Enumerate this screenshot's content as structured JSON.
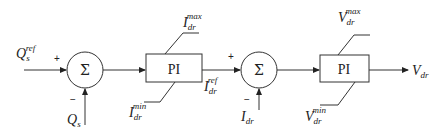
{
  "diagram": {
    "type": "control-block-diagram",
    "stroke_color": "#333333",
    "background": "#ffffff",
    "inputs": {
      "q_ref": {
        "base": "Q",
        "sub": "s",
        "sup": "ref"
      },
      "q_meas": {
        "base": "Q",
        "sub": "s"
      },
      "i_meas": {
        "base": "I",
        "sub": "dr"
      }
    },
    "sum1": {
      "symbol": "Σ",
      "plus": "+",
      "minus": "−"
    },
    "pi1": {
      "label": "PI",
      "max": {
        "base": "I",
        "sub": "dr",
        "sup": "max"
      },
      "min": {
        "base": "I",
        "sub": "dr",
        "sup": "min"
      }
    },
    "intermediate": {
      "base": "I",
      "sub": "dr",
      "sup": "ref"
    },
    "sum2": {
      "symbol": "Σ",
      "plus": "+",
      "minus": "−"
    },
    "pi2": {
      "label": "PI",
      "max": {
        "base": "V",
        "sub": "dr",
        "sup": "max"
      },
      "min": {
        "base": "V",
        "sub": "dr",
        "sup": "min"
      }
    },
    "output": {
      "base": "V",
      "sub": "dr"
    }
  }
}
